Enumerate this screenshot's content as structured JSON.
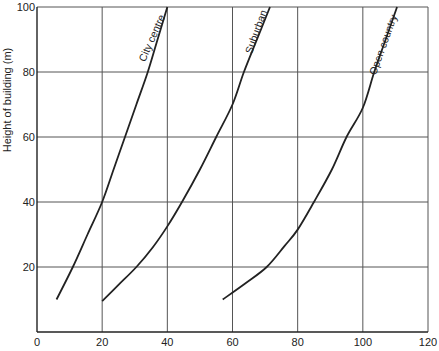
{
  "chart_data": {
    "type": "line",
    "title": "",
    "xlabel": "",
    "ylabel": "Height of building (m)",
    "xlim": [
      0,
      120
    ],
    "ylim": [
      0,
      100
    ],
    "grid": true,
    "legend": "inline labels on curves",
    "x_ticks": [
      0,
      20,
      40,
      60,
      80,
      100,
      120
    ],
    "y_ticks": [
      20,
      40,
      60,
      80,
      100
    ],
    "series": [
      {
        "name": "City centre",
        "points": [
          [
            6,
            10
          ],
          [
            11,
            20
          ],
          [
            15.5,
            30
          ],
          [
            20,
            40
          ],
          [
            23.5,
            50
          ],
          [
            27,
            60
          ],
          [
            30.5,
            70
          ],
          [
            34,
            80
          ],
          [
            37,
            90
          ],
          [
            40,
            100
          ]
        ]
      },
      {
        "name": "Suburban",
        "points": [
          [
            20,
            9.5
          ],
          [
            25,
            14.5
          ],
          [
            30.5,
            20
          ],
          [
            35.5,
            26
          ],
          [
            40,
            32.5
          ],
          [
            44.5,
            40
          ],
          [
            50,
            50
          ],
          [
            55,
            60
          ],
          [
            60,
            70
          ],
          [
            63.5,
            80
          ],
          [
            67.5,
            90
          ],
          [
            71.5,
            100
          ]
        ]
      },
      {
        "name": "Open country",
        "points": [
          [
            57,
            10
          ],
          [
            64,
            15
          ],
          [
            70.5,
            20
          ],
          [
            76,
            26.5
          ],
          [
            80,
            31.5
          ],
          [
            85,
            40
          ],
          [
            90.5,
            50
          ],
          [
            95,
            60
          ],
          [
            100,
            69
          ],
          [
            103.5,
            80
          ],
          [
            107,
            90
          ],
          [
            110.5,
            100
          ]
        ]
      }
    ]
  }
}
